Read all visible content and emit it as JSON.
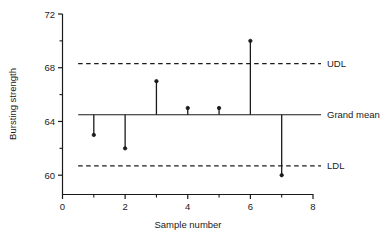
{
  "chart_data": {
    "type": "scatter",
    "title": "",
    "xlabel": "Sample number",
    "ylabel": "Bursting strength",
    "xlim": [
      0,
      8
    ],
    "ylim": [
      58.6,
      72
    ],
    "x_ticks": [
      0,
      2,
      4,
      6,
      8
    ],
    "x_tick_labels": [
      "0",
      "2",
      "4",
      "6",
      "8"
    ],
    "x_minor_ticks": [
      1,
      3,
      5,
      7
    ],
    "y_ticks": [
      60,
      64,
      68,
      72
    ],
    "y_tick_labels": [
      "60",
      "64",
      "68",
      "72"
    ],
    "y_minor_ticks": [
      62,
      66,
      70
    ],
    "grid": false,
    "legend": "none",
    "x": [
      1,
      2,
      3,
      4,
      5,
      6,
      7
    ],
    "values": [
      63.0,
      62.0,
      67.0,
      65.0,
      65.0,
      70.0,
      60.0
    ],
    "series": [
      {
        "name": "Sample means",
        "x": [
          1,
          2,
          3,
          4,
          5,
          6,
          7
        ],
        "values": [
          63.0,
          62.0,
          67.0,
          65.0,
          65.0,
          70.0,
          60.0
        ]
      }
    ],
    "reference_lines": [
      {
        "name": "UDL",
        "label": "UDL",
        "value": 68.3,
        "style": "dashed"
      },
      {
        "name": "Grand mean",
        "label": "Grand mean",
        "value": 64.5,
        "style": "solid"
      },
      {
        "name": "LDL",
        "label": "LDL",
        "value": 60.7,
        "style": "dashed"
      }
    ],
    "annotations": [
      "UDL",
      "Grand mean",
      "LDL"
    ],
    "colors": {
      "line": "#1a1a1a",
      "marker": "#1a1a1a",
      "axis": "#1a1a1a"
    }
  },
  "axes": {
    "y_title": "Bursting strength",
    "x_title": "Sample number"
  },
  "labels": {
    "udl": "UDL",
    "grand_mean": "Grand mean",
    "ldl": "LDL"
  }
}
